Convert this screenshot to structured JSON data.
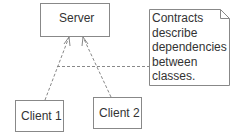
{
  "diagram": {
    "type": "uml-class-dependency",
    "nodes": [
      {
        "id": "server",
        "label": "Server"
      },
      {
        "id": "client1",
        "label": "Client 1"
      },
      {
        "id": "client2",
        "label": "Client 2"
      }
    ],
    "edges": [
      {
        "from": "client1",
        "to": "server",
        "style": "dashed",
        "arrow": "open"
      },
      {
        "from": "client2",
        "to": "server",
        "style": "dashed",
        "arrow": "open"
      }
    ],
    "note": {
      "lines": [
        "Contracts",
        "describe",
        "dependencies",
        "between",
        "classes."
      ],
      "anchor": "dependency-edges"
    }
  },
  "colors": {
    "line": "#888888",
    "text": "#333333",
    "background": "#ffffff"
  }
}
